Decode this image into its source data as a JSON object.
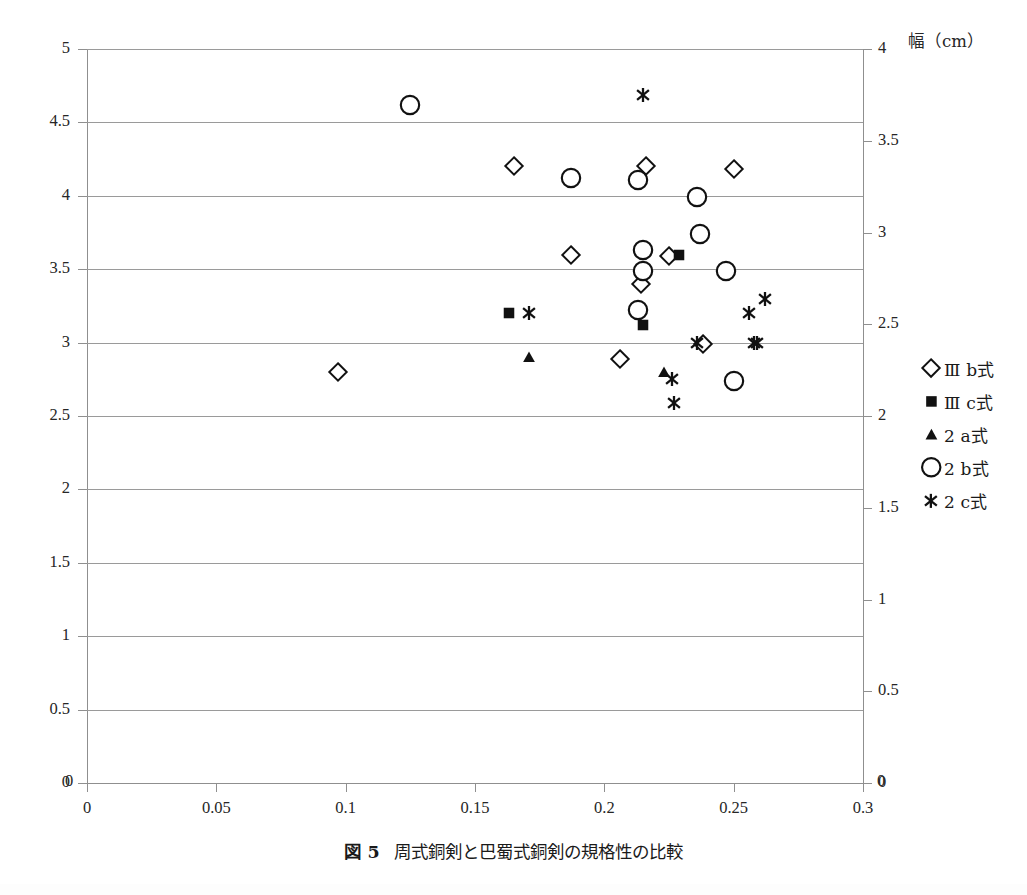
{
  "caption": {
    "number": "図 5",
    "text": "周式銅剣と巴蜀式銅剣の規格性の比較"
  },
  "axes": {
    "left": {
      "ticks": [
        "0",
        "0.5",
        "1",
        "1.5",
        "2",
        "2.5",
        "3",
        "3.5",
        "4",
        "4.5",
        "5"
      ],
      "min": 0,
      "max": 5
    },
    "right": {
      "title": "幅（cm）",
      "ticks": [
        "0",
        "0.5",
        "1",
        "1.5",
        "2",
        "2.5",
        "3",
        "3.5",
        "4"
      ],
      "min": 0,
      "max": 4
    },
    "bottom": {
      "ticks": [
        "0",
        "0.05",
        "0.1",
        "0.15",
        "0.2",
        "0.25",
        "0.3"
      ],
      "min": 0,
      "max": 0.3
    }
  },
  "legend": [
    {
      "key": "IIIb",
      "marker": "open-diamond",
      "label": "Ⅲ b式"
    },
    {
      "key": "IIIc",
      "marker": "filled-square",
      "label": "Ⅲ c式"
    },
    {
      "key": "2a",
      "marker": "filled-triangle",
      "label": "2 a式"
    },
    {
      "key": "2b",
      "marker": "open-circle",
      "label": "2 b式"
    },
    {
      "key": "2c",
      "marker": "filled-star",
      "label": "2 c式"
    }
  ],
  "chart_data": {
    "type": "scatter",
    "title": "周式銅剣と巴蜀式銅剣の規格性の比較",
    "xlabel": "",
    "ylabel": "",
    "ylabel_right": "幅（cm）",
    "xlim": [
      0,
      0.3
    ],
    "ylim": [
      0,
      5
    ],
    "ylim_right": [
      0,
      4
    ],
    "grid": "horizontal",
    "legend_position": "right",
    "series": [
      {
        "name": "Ⅲ b式",
        "marker": "open-diamond",
        "points": [
          [
            0.097,
            2.8
          ],
          [
            0.165,
            4.2
          ],
          [
            0.187,
            3.6
          ],
          [
            0.206,
            2.89
          ],
          [
            0.213,
            3.22
          ],
          [
            0.214,
            3.4
          ],
          [
            0.216,
            4.2
          ],
          [
            0.225,
            3.59
          ],
          [
            0.238,
            2.99
          ],
          [
            0.25,
            4.18
          ]
        ]
      },
      {
        "name": "Ⅲ c式",
        "marker": "filled-square",
        "points": [
          [
            0.163,
            3.2
          ],
          [
            0.215,
            3.12
          ],
          [
            0.229,
            3.6
          ]
        ]
      },
      {
        "name": "2 a式",
        "marker": "filled-triangle",
        "points": [
          [
            0.171,
            2.9
          ],
          [
            0.223,
            2.8
          ]
        ]
      },
      {
        "name": "2 b式",
        "marker": "open-circle",
        "points": [
          [
            0.125,
            4.62
          ],
          [
            0.187,
            4.12
          ],
          [
            0.213,
            4.11
          ],
          [
            0.213,
            3.22
          ],
          [
            0.215,
            3.63
          ],
          [
            0.215,
            3.49
          ],
          [
            0.236,
            3.99
          ],
          [
            0.237,
            3.74
          ],
          [
            0.247,
            3.49
          ],
          [
            0.25,
            2.74
          ]
        ]
      },
      {
        "name": "2 c式",
        "marker": "filled-star",
        "points": [
          [
            0.171,
            3.2
          ],
          [
            0.215,
            4.69
          ],
          [
            0.226,
            2.75
          ],
          [
            0.227,
            2.59
          ],
          [
            0.236,
            3.0
          ],
          [
            0.256,
            3.2
          ],
          [
            0.258,
            3.0
          ],
          [
            0.259,
            3.0
          ],
          [
            0.262,
            3.3
          ]
        ]
      }
    ]
  }
}
